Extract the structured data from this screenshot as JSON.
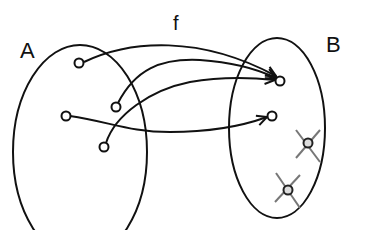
{
  "diagram": {
    "function_label": "f",
    "domain": {
      "label": "A",
      "ellipse": {
        "cx": 78,
        "cy": 147,
        "rx": 68,
        "ry": 113
      },
      "elements": [
        {
          "id": "a1",
          "x": 79,
          "y": 63
        },
        {
          "id": "a2",
          "x": 116,
          "y": 107
        },
        {
          "id": "a3",
          "x": 66,
          "y": 116
        },
        {
          "id": "a4",
          "x": 104,
          "y": 147
        }
      ]
    },
    "codomain": {
      "label": "B",
      "ellipse": {
        "cx": 276,
        "cy": 127,
        "rx": 48,
        "ry": 91
      },
      "elements": [
        {
          "id": "b1",
          "x": 279,
          "y": 80,
          "mapped": true
        },
        {
          "id": "b2",
          "x": 271,
          "y": 116,
          "mapped": true
        },
        {
          "id": "b3",
          "x": 307,
          "y": 143,
          "mapped": false,
          "crossed": true
        },
        {
          "id": "b4",
          "x": 287,
          "y": 189,
          "mapped": false,
          "crossed": true
        }
      ]
    },
    "mappings": [
      {
        "from": "a1",
        "to": "b1"
      },
      {
        "from": "a2",
        "to": "b1"
      },
      {
        "from": "a4",
        "to": "b1"
      },
      {
        "from": "a3",
        "to": "b2"
      }
    ],
    "colors": {
      "stroke": "#111111",
      "cross": "#777777",
      "background": "#ffffff"
    }
  }
}
